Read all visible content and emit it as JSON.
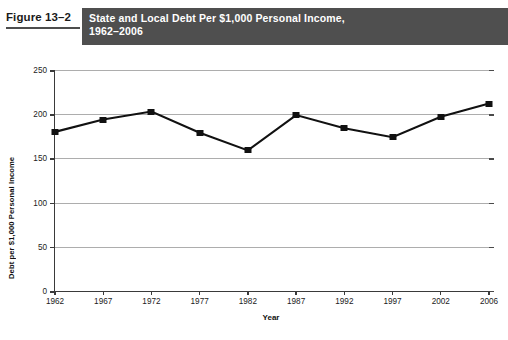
{
  "figure": {
    "number_label": "Figure 13–2",
    "title_line1": "State and Local Debt Per $1,000 Personal Income,",
    "title_line2": "1962–2006",
    "band_color": "#4f4f4f"
  },
  "chart_data": {
    "type": "line",
    "title": "State and Local Debt Per $1,000 Personal Income, 1962–2006",
    "xlabel": "Year",
    "ylabel": "Debt per $1,000 Personal Income",
    "categories": [
      "1962",
      "1967",
      "1972",
      "1977",
      "1982",
      "1987",
      "1992",
      "1997",
      "2002",
      "2006"
    ],
    "values": [
      180,
      194,
      203,
      179,
      159,
      199,
      184,
      174,
      197,
      212
    ],
    "ylim": [
      0,
      250
    ],
    "yticks": [
      0,
      50,
      100,
      150,
      200,
      250
    ],
    "ytick_labels": [
      "0",
      "50",
      "100",
      "150",
      "200",
      "250"
    ],
    "grid": true,
    "legend": "none",
    "series_color": "#111111",
    "marker": "square",
    "gridline_color": "#adadad",
    "axis_color": "#3a3a3a"
  }
}
